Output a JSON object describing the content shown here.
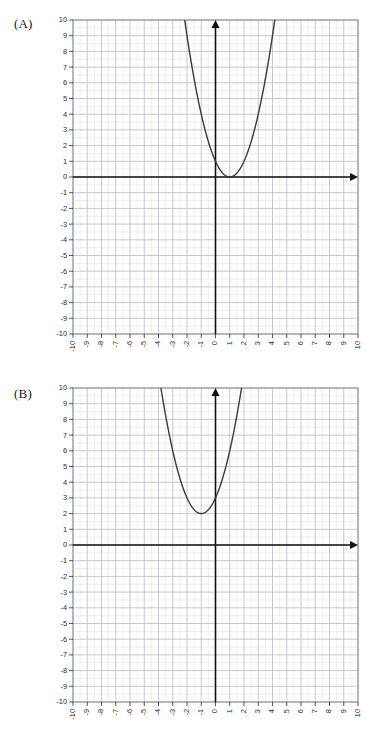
{
  "page": {
    "background": "#ffffff",
    "width": 386,
    "height": 732
  },
  "panels": [
    {
      "id": "A",
      "label": "(A)"
    },
    {
      "id": "B",
      "label": "(B)"
    }
  ],
  "axis_ticks": {
    "y": [
      "10",
      "9",
      "8",
      "7",
      "6",
      "5",
      "4",
      "3",
      "2",
      "1",
      "0",
      "-1",
      "-2",
      "-3",
      "-4",
      "-5",
      "-6",
      "-7",
      "-8",
      "-9",
      "-10"
    ],
    "x": [
      "-10",
      "-9",
      "-8",
      "-7",
      "-6",
      "-5",
      "-4",
      "-3",
      "-2",
      "-1",
      "0",
      "1",
      "2",
      "3",
      "4",
      "5",
      "6",
      "7",
      "8",
      "9",
      "10"
    ]
  },
  "colors": {
    "axis": "#111111",
    "curve": "#3a3a3a",
    "major_grid": "#b9bcc4",
    "minor_grid": "#e2e4ea",
    "frame": "#8d9199",
    "tick_text": "#2b2b2b",
    "label_text": "#1a1a1a"
  },
  "chart_data": [
    {
      "type": "line",
      "title": "(A)",
      "xlabel": "",
      "ylabel": "",
      "xlim": [
        -10,
        10
      ],
      "ylim": [
        -10,
        10
      ],
      "grid": true,
      "minor_grid": true,
      "legend": "none",
      "curve": "parabola",
      "equation": "y = (x - 1)^2",
      "vertex": [
        1,
        0
      ],
      "a": 1,
      "x_intercepts": [
        1
      ],
      "y_intercept": 1,
      "visible_top_exits_x": [
        -2.16,
        4.16
      ],
      "points": [
        {
          "x": -2.16,
          "y": 10.0
        },
        {
          "x": -2.0,
          "y": 9.0
        },
        {
          "x": -1.5,
          "y": 6.25
        },
        {
          "x": -1.0,
          "y": 4.0
        },
        {
          "x": -0.5,
          "y": 2.25
        },
        {
          "x": 0.0,
          "y": 1.0
        },
        {
          "x": 0.5,
          "y": 0.25
        },
        {
          "x": 1.0,
          "y": 0.0
        },
        {
          "x": 1.5,
          "y": 0.25
        },
        {
          "x": 2.0,
          "y": 1.0
        },
        {
          "x": 2.5,
          "y": 2.25
        },
        {
          "x": 3.0,
          "y": 4.0
        },
        {
          "x": 3.5,
          "y": 6.25
        },
        {
          "x": 4.0,
          "y": 9.0
        },
        {
          "x": 4.16,
          "y": 10.0
        }
      ]
    },
    {
      "type": "line",
      "title": "(B)",
      "xlabel": "",
      "ylabel": "",
      "xlim": [
        -10,
        10
      ],
      "ylim": [
        -10,
        10
      ],
      "grid": true,
      "minor_grid": true,
      "legend": "none",
      "curve": "parabola",
      "equation": "y = (x + 1)^2 + 2",
      "vertex": [
        -1,
        2
      ],
      "a": 1,
      "x_intercepts": [],
      "y_intercept": 3,
      "visible_top_exits_x": [
        -3.83,
        1.83
      ],
      "points": [
        {
          "x": -3.83,
          "y": 10.0
        },
        {
          "x": -3.5,
          "y": 8.25
        },
        {
          "x": -3.0,
          "y": 6.0
        },
        {
          "x": -2.5,
          "y": 4.25
        },
        {
          "x": -2.0,
          "y": 3.0
        },
        {
          "x": -1.5,
          "y": 2.25
        },
        {
          "x": -1.0,
          "y": 2.0
        },
        {
          "x": -0.5,
          "y": 2.25
        },
        {
          "x": 0.0,
          "y": 3.0
        },
        {
          "x": 0.5,
          "y": 4.25
        },
        {
          "x": 1.0,
          "y": 6.0
        },
        {
          "x": 1.5,
          "y": 8.25
        },
        {
          "x": 1.83,
          "y": 10.0
        }
      ]
    }
  ]
}
